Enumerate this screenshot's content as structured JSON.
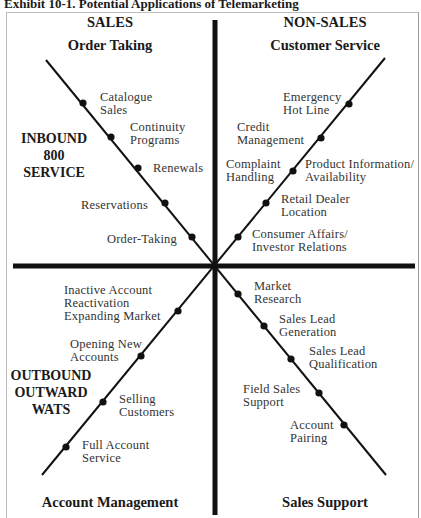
{
  "title": "Exhibit 10-1. Potential Applications of Telemarketing",
  "headers": {
    "sales": "SALES",
    "non_sales": "NON-SALES",
    "top_left": "Order Taking",
    "top_right": "Customer Service",
    "bottom_left": "Account Management",
    "bottom_right": "Sales Support"
  },
  "side_labels": {
    "inbound": [
      "INBOUND",
      "800",
      "SERVICE"
    ],
    "outbound": [
      "OUTBOUND",
      "OUTWARD",
      "WATS"
    ]
  },
  "quadrants": {
    "upper_left": [
      {
        "lines": [
          "Catalogue",
          "Sales"
        ]
      },
      {
        "lines": [
          "Continuity",
          "Programs"
        ]
      },
      {
        "lines": [
          "Renewals"
        ]
      },
      {
        "lines": [
          "Reservations"
        ]
      },
      {
        "lines": [
          "Order-Taking"
        ]
      }
    ],
    "upper_right": [
      {
        "lines": [
          "Emergency",
          "Hot Line"
        ]
      },
      {
        "lines": [
          "Credit",
          "Management"
        ]
      },
      {
        "lines": [
          "Complaint",
          "Handling"
        ]
      },
      {
        "lines": [
          "Product Information/",
          "Availability"
        ]
      },
      {
        "lines": [
          "Retail Dealer",
          "Location"
        ]
      },
      {
        "lines": [
          "Consumer Affairs/",
          "Investor Relations"
        ]
      }
    ],
    "lower_left": [
      {
        "lines": [
          "Inactive Account",
          "Reactivation",
          "Expanding Market"
        ]
      },
      {
        "lines": [
          "Opening New",
          "Accounts"
        ]
      },
      {
        "lines": [
          "Selling",
          "Customers"
        ]
      },
      {
        "lines": [
          "Full Account",
          "Service"
        ]
      }
    ],
    "lower_right": [
      {
        "lines": [
          "Market",
          "Research"
        ]
      },
      {
        "lines": [
          "Sales Lead",
          "Generation"
        ]
      },
      {
        "lines": [
          "Sales Lead",
          "Qualification"
        ]
      },
      {
        "lines": [
          "Field Sales",
          "Support"
        ]
      },
      {
        "lines": [
          "Account",
          "Pairing"
        ]
      }
    ]
  }
}
